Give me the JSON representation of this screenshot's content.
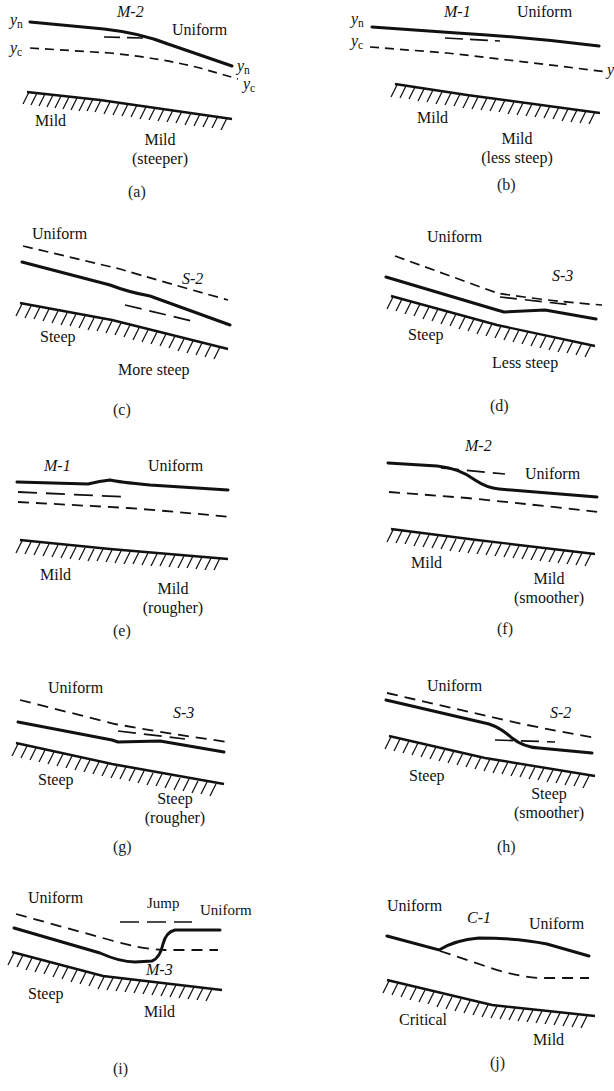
{
  "figure": {
    "background": "#ffffff",
    "ink": "#111111"
  },
  "panels": [
    {
      "letter": "(a)",
      "profile": "M-2",
      "labels": {
        "yn_left": "y",
        "yn_left_sub": "n",
        "yc_left": "y",
        "yc_left_sub": "c",
        "yn_right": "y",
        "yn_right_sub": "n",
        "yc_right": "y",
        "yc_right_sub": "c",
        "uniform": "Uniform",
        "bed_left": "Mild",
        "bed_right": "Mild",
        "bed_right_note": "(steeper)"
      }
    },
    {
      "letter": "(b)",
      "profile": "M-1",
      "labels": {
        "yn_left": "y",
        "yn_left_sub": "n",
        "yc_left": "y",
        "yc_left_sub": "c",
        "y_right": "y",
        "uniform": "Uniform",
        "bed_left": "Mild",
        "bed_right": "Mild",
        "bed_right_note": "(less steep)"
      }
    },
    {
      "letter": "(c)",
      "profile": "S-2",
      "labels": {
        "uniform": "Uniform",
        "bed_left": "Steep",
        "bed_right": "More steep"
      }
    },
    {
      "letter": "(d)",
      "profile": "S-3",
      "labels": {
        "uniform": "Uniform",
        "bed_left": "Steep",
        "bed_right": "Less steep"
      }
    },
    {
      "letter": "(e)",
      "profile": "M-1",
      "labels": {
        "uniform": "Uniform",
        "bed_left": "Mild",
        "bed_right": "Mild",
        "bed_right_note": "(rougher)"
      }
    },
    {
      "letter": "(f)",
      "profile": "M-2",
      "labels": {
        "uniform": "Uniform",
        "bed_left": "Mild",
        "bed_right": "Mild",
        "bed_right_note": "(smoother)"
      }
    },
    {
      "letter": "(g)",
      "profile": "S-3",
      "labels": {
        "uniform": "Uniform",
        "bed_left": "Steep",
        "bed_right": "Steep",
        "bed_right_note": "(rougher)"
      }
    },
    {
      "letter": "(h)",
      "profile": "S-2",
      "labels": {
        "uniform": "Uniform",
        "bed_left": "Steep",
        "bed_right": "Steep",
        "bed_right_note": "(smoother)"
      }
    },
    {
      "letter": "(i)",
      "profile": "M-3",
      "labels": {
        "uniform_left": "Uniform",
        "jump": "Jump",
        "uniform_right": "Uniform",
        "bed_left": "Steep",
        "bed_right": "Mild"
      }
    },
    {
      "letter": "(j)",
      "profile": "C-1",
      "labels": {
        "uniform_left": "Uniform",
        "uniform_right": "Uniform",
        "bed_left": "Critical",
        "bed_right": "Mild"
      }
    }
  ]
}
